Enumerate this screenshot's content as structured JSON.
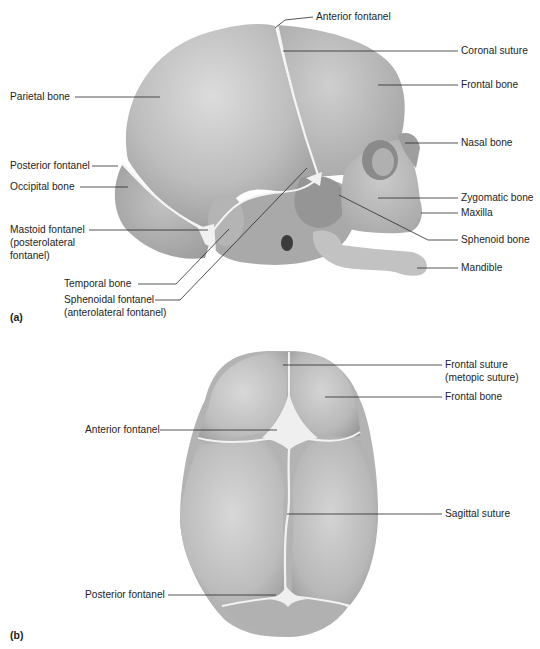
{
  "figure": {
    "panels": [
      {
        "id": "a",
        "tag": "(a)",
        "view": "lateral",
        "labels": {
          "anterior_fontanel": "Anterior fontanel",
          "coronal_suture": "Coronal suture",
          "frontal_bone": "Frontal bone",
          "parietal_bone": "Parietal bone",
          "nasal_bone": "Nasal bone",
          "posterior_fontanel": "Posterior fontanel",
          "occipital_bone": "Occipital bone",
          "zygomatic_bone": "Zygomatic bone",
          "maxilla": "Maxilla",
          "mastoid_fontanel_1": "Mastoid fontanel",
          "mastoid_fontanel_2": "(posterolateral",
          "mastoid_fontanel_3": "fontanel)",
          "sphenoid_bone": "Sphenoid bone",
          "mandible": "Mandible",
          "temporal_bone": "Temporal bone",
          "sphenoidal_fontanel_1": "Sphenoidal fontanel",
          "sphenoidal_fontanel_2": "(anterolateral fontanel)"
        }
      },
      {
        "id": "b",
        "tag": "(b)",
        "view": "superior",
        "labels": {
          "frontal_suture_1": "Frontal suture",
          "frontal_suture_2": "(metopic suture)",
          "frontal_bone": "Frontal bone",
          "anterior_fontanel": "Anterior fontanel",
          "sagittal_suture": "Sagittal suture",
          "posterior_fontanel": "Posterior fontanel"
        }
      }
    ],
    "colors": {
      "bone": "#b9b9b9",
      "bone_light": "#d6d6d6",
      "bone_dark": "#8f8f8f",
      "fontanel": "#f2f2f2",
      "leader_line": "#2a2a2a",
      "text": "#1e1e1e"
    }
  }
}
